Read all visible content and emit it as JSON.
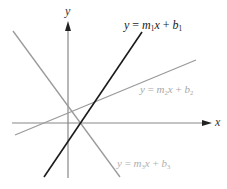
{
  "diagram": {
    "title": "",
    "axes": {
      "x_label": "x",
      "y_label": "y",
      "color": "#888888",
      "arrow_color": "#222222"
    },
    "lines": [
      {
        "id": "line1",
        "name": "y = m1 x + b1",
        "var": "y",
        "eq": "=",
        "m": "m",
        "m_sub": "1",
        "x": "x",
        "plus": "+",
        "b": "b",
        "b_sub": "1",
        "color": "#1a1a1a",
        "label_color": "#1a1a1a"
      },
      {
        "id": "line2",
        "name": "y = m2 x + b2",
        "var": "y",
        "eq": "=",
        "m": "m",
        "m_sub": "2",
        "x": "x",
        "plus": "+",
        "b": "b",
        "b_sub": "2",
        "color": "#9a9a9a",
        "label_color": "#a8a8a8"
      },
      {
        "id": "line3",
        "name": "y = m3 x + b3",
        "var": "y",
        "eq": "=",
        "m": "m",
        "m_sub": "3",
        "x": "x",
        "plus": "+",
        "b": "b",
        "b_sub": "3",
        "color": "#9a9a9a",
        "label_color": "#b0b0b0"
      }
    ]
  }
}
